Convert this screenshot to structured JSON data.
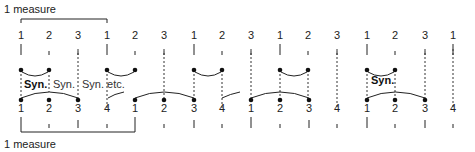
{
  "diagram": {
    "top_bracket_label": "1 measure",
    "bottom_bracket_label": "1 measure",
    "top_row": {
      "meter": 3,
      "beats": [
        {
          "label": "1",
          "x": 21
        },
        {
          "label": "2",
          "x": 49
        },
        {
          "label": "3",
          "x": 78
        },
        {
          "label": "1",
          "x": 107
        },
        {
          "label": "2",
          "x": 135
        },
        {
          "label": "3",
          "x": 164
        },
        {
          "label": "1",
          "x": 194
        },
        {
          "label": "2",
          "x": 222
        },
        {
          "label": "3",
          "x": 251
        },
        {
          "label": "1",
          "x": 280
        },
        {
          "label": "2",
          "x": 308
        },
        {
          "label": "3",
          "x": 337
        },
        {
          "label": "1",
          "x": 367
        },
        {
          "label": "2",
          "x": 395
        },
        {
          "label": "3",
          "x": 425
        },
        {
          "label": "1",
          "x": 453
        }
      ]
    },
    "bottom_row": {
      "meter": 4,
      "beats": [
        {
          "label": "1",
          "x": 21
        },
        {
          "label": "2",
          "x": 49
        },
        {
          "label": "3",
          "x": 78
        },
        {
          "label": "4",
          "x": 107
        },
        {
          "label": "1",
          "x": 135
        },
        {
          "label": "2",
          "x": 164
        },
        {
          "label": "3",
          "x": 194
        },
        {
          "label": "4",
          "x": 222
        },
        {
          "label": "1",
          "x": 251
        },
        {
          "label": "2",
          "x": 280
        },
        {
          "label": "3",
          "x": 309
        },
        {
          "label": "4",
          "x": 337
        },
        {
          "label": "1",
          "x": 367
        },
        {
          "label": "2",
          "x": 395
        },
        {
          "label": "3",
          "x": 425
        },
        {
          "label": "4",
          "x": 453
        }
      ]
    },
    "annotations": {
      "syn_bold_1": "Syn.",
      "syn_2": "Syn.",
      "syn_etc": "Syn. etc.",
      "syn_bold_2": "Syn."
    },
    "line_color": "#222222"
  }
}
